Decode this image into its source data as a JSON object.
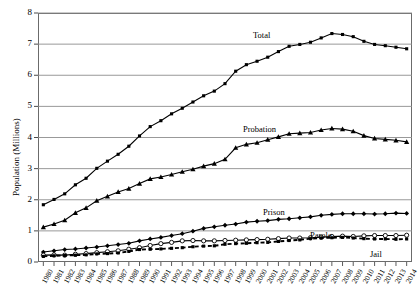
{
  "chart_data": {
    "type": "line",
    "title": "",
    "xlabel": "",
    "ylabel": "Population (Millions)",
    "ylim": [
      0,
      8
    ],
    "ytick_values": [
      0,
      1,
      2,
      3,
      4,
      5,
      6,
      7,
      8
    ],
    "ytick_labels": [
      "0",
      "1",
      "2",
      "3",
      "4",
      "5",
      "6",
      "7",
      "8"
    ],
    "grid": true,
    "legend_position": "inline-labels",
    "x": [
      1980,
      1981,
      1982,
      1983,
      1984,
      1985,
      1986,
      1987,
      1988,
      1989,
      1990,
      1991,
      1992,
      1993,
      1994,
      1995,
      1996,
      1997,
      1998,
      1999,
      2000,
      2001,
      2002,
      2003,
      2004,
      2005,
      2006,
      2007,
      2008,
      2009,
      2010,
      2011,
      2012,
      2013,
      2014
    ],
    "xtick_labels": [
      "1980",
      "1981",
      "1982",
      "1983",
      "1984",
      "1985",
      "1986",
      "1987",
      "1988",
      "1989",
      "1990",
      "1991",
      "1992",
      "1993",
      "1994",
      "1995",
      "1996",
      "1997",
      "1998",
      "1999",
      "2000",
      "2001",
      "2002",
      "2003",
      "2004",
      "2005",
      "2006",
      "2007",
      "2008",
      "2009",
      "2010",
      "2011",
      "2012",
      "2013",
      "2014"
    ],
    "series": [
      {
        "name": "Total",
        "label": "Total",
        "marker": "filled-square",
        "linestyle": "solid",
        "color": "#000000",
        "values": [
          1.84,
          2.01,
          2.19,
          2.48,
          2.69,
          3.01,
          3.24,
          3.46,
          3.72,
          4.05,
          4.35,
          4.54,
          4.76,
          4.94,
          5.14,
          5.34,
          5.49,
          5.73,
          6.13,
          6.34,
          6.45,
          6.58,
          6.76,
          6.93,
          6.99,
          7.06,
          7.2,
          7.34,
          7.31,
          7.24,
          7.09,
          6.99,
          6.95,
          6.9,
          6.85
        ]
      },
      {
        "name": "Probation",
        "label": "Probation",
        "marker": "filled-triangle",
        "linestyle": "solid",
        "color": "#000000",
        "values": [
          1.12,
          1.22,
          1.34,
          1.58,
          1.74,
          1.97,
          2.11,
          2.25,
          2.36,
          2.52,
          2.67,
          2.73,
          2.81,
          2.9,
          2.98,
          3.08,
          3.16,
          3.3,
          3.67,
          3.78,
          3.83,
          3.93,
          4.02,
          4.12,
          4.14,
          4.16,
          4.24,
          4.29,
          4.27,
          4.2,
          4.06,
          3.97,
          3.94,
          3.91,
          3.86
        ]
      },
      {
        "name": "Prison",
        "label": "Prison",
        "marker": "filled-diamond",
        "linestyle": "solid",
        "color": "#000000",
        "values": [
          0.32,
          0.36,
          0.4,
          0.42,
          0.45,
          0.48,
          0.52,
          0.56,
          0.6,
          0.68,
          0.74,
          0.79,
          0.85,
          0.91,
          0.99,
          1.08,
          1.13,
          1.18,
          1.22,
          1.28,
          1.31,
          1.33,
          1.37,
          1.39,
          1.42,
          1.45,
          1.5,
          1.53,
          1.55,
          1.55,
          1.55,
          1.54,
          1.55,
          1.57,
          1.56
        ]
      },
      {
        "name": "Parole",
        "label": "Parole",
        "marker": "open-circle",
        "linestyle": "solid",
        "color": "#000000",
        "values": [
          0.22,
          0.23,
          0.22,
          0.25,
          0.27,
          0.3,
          0.33,
          0.36,
          0.41,
          0.46,
          0.53,
          0.59,
          0.63,
          0.68,
          0.69,
          0.68,
          0.68,
          0.69,
          0.7,
          0.71,
          0.72,
          0.73,
          0.75,
          0.77,
          0.77,
          0.78,
          0.8,
          0.82,
          0.83,
          0.82,
          0.84,
          0.85,
          0.85,
          0.85,
          0.86
        ]
      },
      {
        "name": "Jail",
        "label": "Jail",
        "marker": "filled-square",
        "linestyle": "dashed",
        "color": "#000000",
        "values": [
          0.18,
          0.2,
          0.21,
          0.22,
          0.23,
          0.26,
          0.27,
          0.29,
          0.34,
          0.4,
          0.41,
          0.42,
          0.44,
          0.46,
          0.49,
          0.51,
          0.52,
          0.57,
          0.59,
          0.6,
          0.62,
          0.63,
          0.66,
          0.69,
          0.71,
          0.75,
          0.77,
          0.78,
          0.79,
          0.77,
          0.75,
          0.74,
          0.74,
          0.73,
          0.74
        ]
      }
    ],
    "series_label_positions": [
      {
        "name": "Total",
        "x_px": 253,
        "y_px": 30
      },
      {
        "name": "Probation",
        "x_px": 243,
        "y_px": 124
      },
      {
        "name": "Prison",
        "x_px": 263,
        "y_px": 207
      },
      {
        "name": "Parole",
        "x_px": 310,
        "y_px": 230
      },
      {
        "name": "Jail",
        "x_px": 370,
        "y_px": 249
      }
    ]
  }
}
